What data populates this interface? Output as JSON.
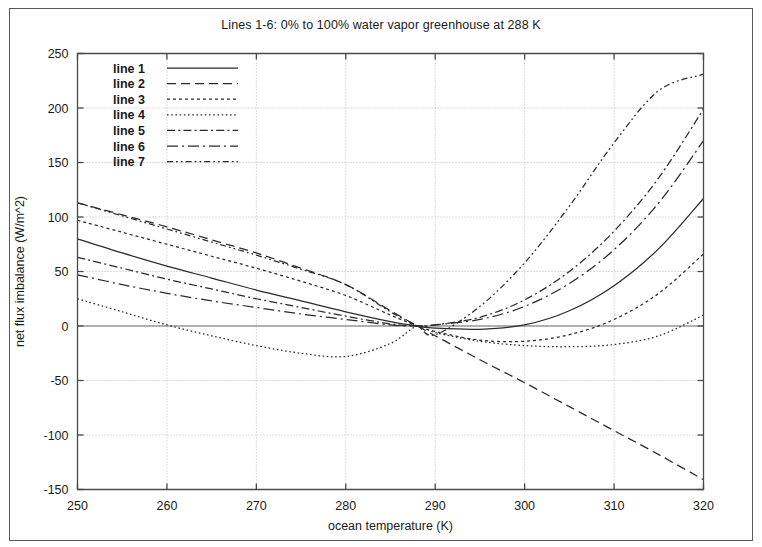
{
  "figure": {
    "title": "Lines 1-6: 0% to 100% water vapor greenhouse at 288 K",
    "background_color": "#ffffff",
    "line_color": "#2b2b2b",
    "grid_color": "#b9b9b9",
    "frame_color": "#4a4a4a"
  },
  "axis_labels": {
    "x": "ocean temperature (K)",
    "y": "net flux imbalance (W/m^2)"
  },
  "x_ticks": [
    "250",
    "260",
    "270",
    "280",
    "290",
    "300",
    "310",
    "320"
  ],
  "y_ticks": [
    "-150",
    "-100",
    "-50",
    "0",
    "50",
    "100",
    "150",
    "200",
    "250"
  ],
  "legend": {
    "items": [
      {
        "label": "line 1",
        "dash": "none"
      },
      {
        "label": "line 2",
        "dash": "8 5"
      },
      {
        "label": "line 3",
        "dash": "3 3"
      },
      {
        "label": "line 4",
        "dash": "1.5 2.5"
      },
      {
        "label": "line 5",
        "dash": "7 3 2 3"
      },
      {
        "label": "line 6",
        "dash": "10 4 2 4"
      },
      {
        "label": "line 7",
        "dash": "5 3 1.5 3 1.5 3"
      }
    ]
  },
  "chart_data": {
    "type": "line",
    "title": "Lines 1-6: 0% to 100% water vapor greenhouse at 288 K",
    "xlabel": "ocean temperature (K)",
    "ylabel": "net flux imbalance (W/m^2)",
    "xlim": [
      250,
      320
    ],
    "ylim": [
      -150,
      250
    ],
    "xticks": [
      250,
      260,
      270,
      280,
      290,
      300,
      310,
      320
    ],
    "yticks": [
      -150,
      -100,
      -50,
      0,
      50,
      100,
      150,
      200,
      250
    ],
    "grid": true,
    "legend_position": "top-left-inside",
    "convergence_point": {
      "x": 288,
      "y": 0
    },
    "x": [
      250,
      255,
      260,
      265,
      270,
      275,
      280,
      285,
      288,
      290,
      295,
      300,
      305,
      310,
      315,
      320
    ],
    "series": [
      {
        "name": "line 1",
        "dash": "solid",
        "values": [
          80,
          67,
          55,
          44,
          33,
          23,
          13,
          4,
          0,
          -2,
          -3,
          1,
          14,
          37,
          71,
          117
        ]
      },
      {
        "name": "line 2",
        "dash": "dashed",
        "values": [
          113,
          102,
          91,
          79,
          67,
          53,
          38,
          14,
          0,
          -9,
          -31,
          -52,
          -74,
          -96,
          -118,
          -141
        ]
      },
      {
        "name": "line 3",
        "dash": "dotted",
        "values": [
          97,
          86,
          75,
          64,
          53,
          41,
          28,
          10,
          0,
          -5,
          -13,
          -14,
          -8,
          6,
          30,
          66
        ]
      },
      {
        "name": "line 4",
        "dash": "fine-dotted",
        "values": [
          25,
          13,
          1,
          -9,
          -18,
          -25,
          -28,
          -16,
          0,
          -6,
          -14,
          -18,
          -19,
          -17,
          -9,
          10
        ]
      },
      {
        "name": "line 5",
        "dash": "dash-dot",
        "values": [
          63,
          53,
          43,
          34,
          25,
          17,
          9,
          2,
          0,
          1,
          8,
          24,
          50,
          87,
          136,
          199
        ]
      },
      {
        "name": "line 6",
        "dash": "long-dash-dot",
        "values": [
          47,
          38,
          30,
          23,
          17,
          11,
          6,
          1,
          0,
          1,
          6,
          18,
          39,
          70,
          113,
          170
        ]
      },
      {
        "name": "line 7",
        "dash": "dash-dot-dot",
        "values": [
          113,
          101,
          89,
          77,
          65,
          52,
          38,
          13,
          0,
          -8,
          18,
          58,
          110,
          168,
          216,
          231
        ]
      }
    ]
  }
}
